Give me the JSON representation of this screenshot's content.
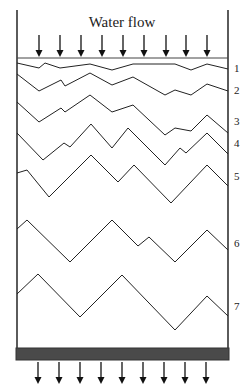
{
  "diagram": {
    "title": "Water flow",
    "layer_labels": [
      "1",
      "2",
      "3",
      "4",
      "5",
      "6",
      "7"
    ],
    "top_arrow_count": 9,
    "bottom_arrow_count": 9,
    "colors": {
      "line": "#222222",
      "wall": "#333333",
      "bottom_bar": "#4a4a4a"
    }
  }
}
